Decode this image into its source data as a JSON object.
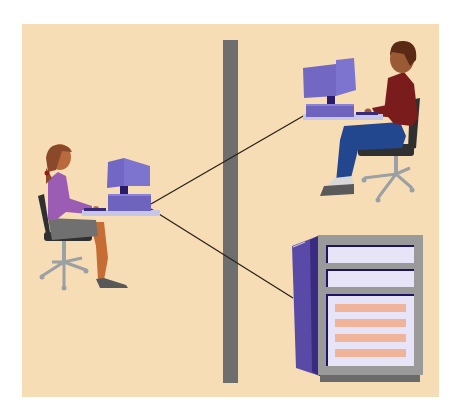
{
  "diagram": {
    "description": "Network illustration: a woman at a workstation connected through a wall to another user's workstation and to a server cabinet",
    "colors": {
      "background": "#f7ddb5",
      "wall": "#6e6e6e",
      "monitor": "#7267c2",
      "monitor_dark": "#3a2a7a",
      "desk": "#c7c6e6",
      "link_line": "#2a2118",
      "server_side": "#5a4aa8",
      "server_frame": "#9a9a9a",
      "server_panel": "#e6e4f6",
      "server_slot": "#f0b49a",
      "woman_top": "#9b5cb4",
      "woman_skirt": "#707070",
      "man_shirt": "#7a1c1c",
      "man_jeans": "#23478e",
      "chair": "#303030",
      "chair_base": "#9aa0a4"
    },
    "nodes": [
      {
        "id": "workstation-local",
        "label": "Local user workstation"
      },
      {
        "id": "workstation-remote",
        "label": "Remote user workstation"
      },
      {
        "id": "server",
        "label": "Server cabinet"
      }
    ],
    "edges": [
      {
        "from": "workstation-local",
        "to": "workstation-remote"
      },
      {
        "from": "workstation-local",
        "to": "server"
      }
    ],
    "separator": {
      "label": "Wall / partition"
    }
  }
}
